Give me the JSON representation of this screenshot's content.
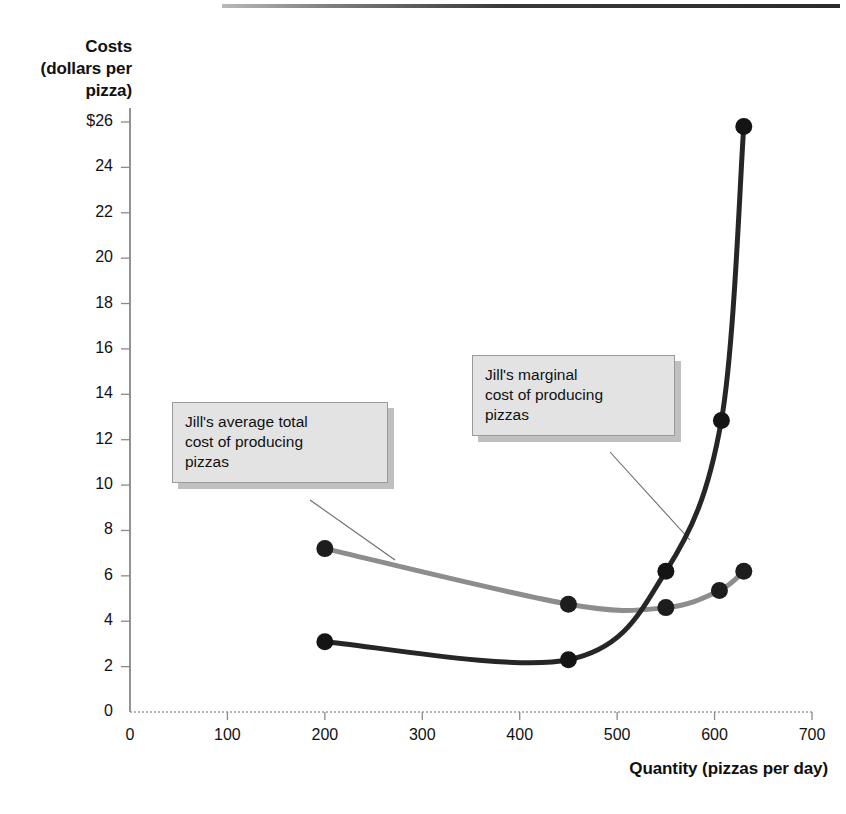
{
  "chart_data": {
    "type": "line",
    "title": "",
    "subtitle": "",
    "xlabel": "Quantity\n(pizzas per day)",
    "ylabel": "Costs\n(dollars\nper pizza)",
    "xlim": [
      0,
      700
    ],
    "ylim": [
      0,
      26
    ],
    "grid": false,
    "legend_position": "annotations",
    "x_ticks": [
      "0",
      "100",
      "200",
      "300",
      "400",
      "500",
      "600",
      "700"
    ],
    "x_tick_values": [
      0,
      100,
      200,
      300,
      400,
      500,
      600,
      700
    ],
    "y_ticks": [
      "0",
      "2",
      "4",
      "6",
      "8",
      "10",
      "12",
      "14",
      "16",
      "18",
      "20",
      "22",
      "24",
      "$26"
    ],
    "y_tick_values": [
      0,
      2,
      4,
      6,
      8,
      10,
      12,
      14,
      16,
      18,
      20,
      22,
      24,
      26
    ],
    "series": [
      {
        "name": "Jill's average total cost of producing pizzas",
        "short_name": "ATC",
        "color": "#8d8d8d",
        "marker_color": "#1d1d1d",
        "points": [
          {
            "x": 200,
            "y": 7.2
          },
          {
            "x": 450,
            "y": 4.75
          },
          {
            "x": 550,
            "y": 4.6
          },
          {
            "x": 605,
            "y": 5.35
          },
          {
            "x": 630,
            "y": 6.2
          }
        ]
      },
      {
        "name": "Jill's marginal cost of producing pizzas",
        "short_name": "MC",
        "color": "#262626",
        "marker_color": "#141414",
        "points": [
          {
            "x": 200,
            "y": 3.1
          },
          {
            "x": 450,
            "y": 2.3
          },
          {
            "x": 550,
            "y": 6.2
          },
          {
            "x": 607,
            "y": 12.85
          },
          {
            "x": 630,
            "y": 25.8
          }
        ]
      }
    ],
    "annotations": [
      {
        "id": "atc",
        "text": "Jill's average total cost of producing pizzas",
        "target_x": 265,
        "target_y": 6.1
      },
      {
        "id": "mc",
        "text": "Jill's marginal cost of producing pizzas",
        "target_x": 545,
        "target_y": 6.0
      }
    ]
  },
  "axes": {
    "y_title": "Costs\n(dollars\nper pizza)",
    "x_title": "Quantity\n(pizzas per day)"
  },
  "callouts": {
    "atc": "Jill's average total\ncost of producing\npizzas",
    "mc": "Jill's marginal\ncost of producing\npizzas"
  },
  "colors": {
    "atc_line": "#8d8d8d",
    "mc_line": "#262626",
    "axis": "#6f6f6f",
    "callout_bg": "#e3e3e3",
    "callout_border": "#9a9a9a",
    "text": "#111111"
  }
}
